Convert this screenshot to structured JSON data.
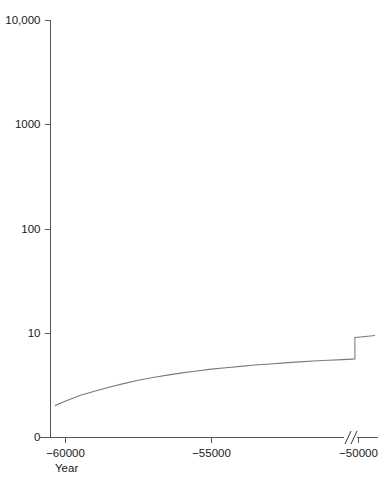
{
  "chart_data": {
    "type": "line",
    "title": "",
    "subtitle": "",
    "xlabel": "Year",
    "ylabel": "",
    "yscale": "log",
    "xscale": "linear",
    "grid": false,
    "legend": null,
    "xlim": [
      -60500,
      -49300
    ],
    "ylim": [
      1,
      10000
    ],
    "axis_break": {
      "symbol": "//",
      "near_tick": "−50000",
      "x_value": -49900
    },
    "y_ticks": [
      {
        "label": "10,000",
        "value": 10000
      },
      {
        "label": "1000",
        "value": 1000
      },
      {
        "label": "100",
        "value": 100
      },
      {
        "label": "10",
        "value": 10
      },
      {
        "label": "0",
        "value": 1
      }
    ],
    "x_ticks": [
      {
        "label": "−60000",
        "value": -60000
      },
      {
        "label": "−55000",
        "value": -55000
      },
      {
        "label": "−50000",
        "value": -50000
      }
    ],
    "series": [
      {
        "name": "population",
        "color": "#7a7a7a",
        "points": [
          {
            "x": -60350,
            "y": 2.0
          },
          {
            "x": -60000,
            "y": 2.2
          },
          {
            "x": -59500,
            "y": 2.5
          },
          {
            "x": -59000,
            "y": 2.75
          },
          {
            "x": -58500,
            "y": 3.0
          },
          {
            "x": -58000,
            "y": 3.25
          },
          {
            "x": -57500,
            "y": 3.5
          },
          {
            "x": -57000,
            "y": 3.72
          },
          {
            "x": -56500,
            "y": 3.92
          },
          {
            "x": -56000,
            "y": 4.12
          },
          {
            "x": -55500,
            "y": 4.3
          },
          {
            "x": -55000,
            "y": 4.48
          },
          {
            "x": -54500,
            "y": 4.62
          },
          {
            "x": -54000,
            "y": 4.76
          },
          {
            "x": -53500,
            "y": 4.9
          },
          {
            "x": -53000,
            "y": 5.02
          },
          {
            "x": -52500,
            "y": 5.14
          },
          {
            "x": -52000,
            "y": 5.25
          },
          {
            "x": -51500,
            "y": 5.35
          },
          {
            "x": -51000,
            "y": 5.45
          },
          {
            "x": -50500,
            "y": 5.52
          },
          {
            "x": -50200,
            "y": 5.58
          },
          {
            "x": -50090,
            "y": 5.6
          },
          {
            "x": -50090,
            "y": 9.0
          },
          {
            "x": -49900,
            "y": 9.1
          },
          {
            "x": -49400,
            "y": 9.4
          }
        ]
      }
    ]
  },
  "axes": {
    "x_title": "Year"
  }
}
